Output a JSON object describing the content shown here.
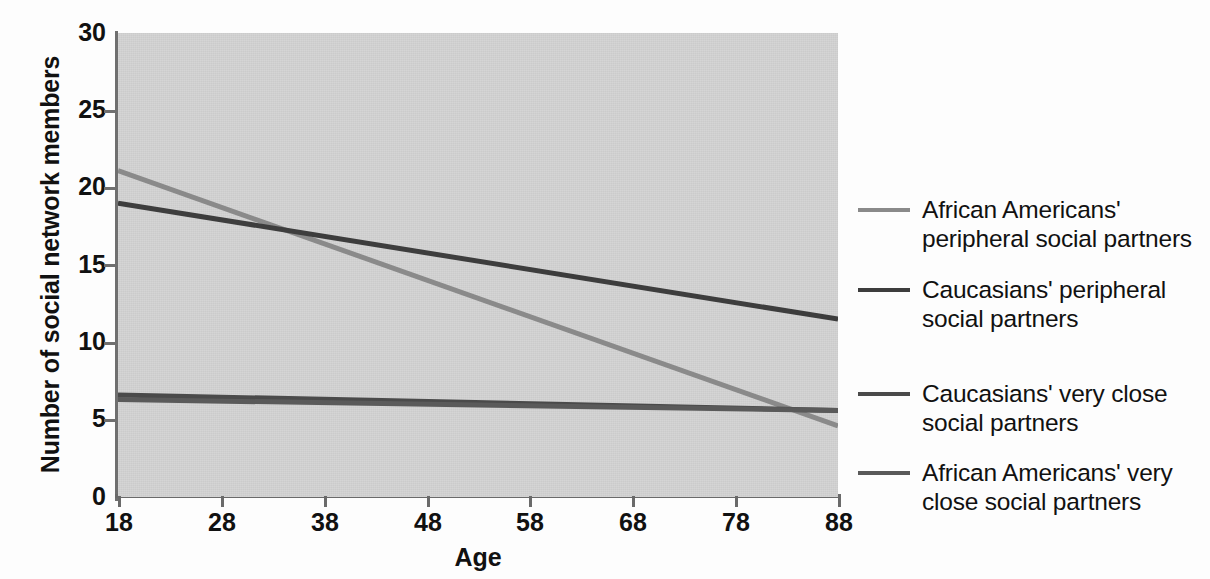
{
  "chart_data": {
    "type": "line",
    "title": "",
    "xlabel": "Age",
    "ylabel": "Number of social network members",
    "xlim": [
      18,
      88
    ],
    "ylim": [
      0,
      30
    ],
    "xticks": [
      18,
      28,
      38,
      48,
      58,
      68,
      78,
      88
    ],
    "yticks": [
      0,
      5,
      10,
      15,
      20,
      25,
      30
    ],
    "grid": false,
    "legend_position": "right",
    "x": [
      18,
      88
    ],
    "series": [
      {
        "name": "African Americans' peripheral social partners",
        "color": "#8a8a8a",
        "values": [
          21.1,
          4.6
        ]
      },
      {
        "name": "Caucasians' peripheral social partners",
        "color": "#3d3d3d",
        "values": [
          19.0,
          11.5
        ]
      },
      {
        "name": "Caucasians' very close social partners",
        "color": "#4a4a4a",
        "values": [
          6.6,
          5.6
        ]
      },
      {
        "name": "African Americans' very close social partners",
        "color": "#5a5a5a",
        "values": [
          6.3,
          5.6
        ]
      }
    ]
  },
  "axes": {
    "ylabel": "Number of social network members",
    "xlabel": "Age",
    "ytick_labels": [
      "30",
      "25",
      "20",
      "15",
      "10",
      "5",
      "0"
    ],
    "xtick_labels": [
      "18",
      "28",
      "38",
      "48",
      "58",
      "68",
      "78",
      "88"
    ]
  },
  "legend": {
    "entries": [
      {
        "label_line1": "African Americans'",
        "label_line2": "peripheral social partners",
        "color": "#8a8a8a"
      },
      {
        "label_line1": "Caucasians' peripheral",
        "label_line2": "social partners",
        "color": "#3d3d3d"
      },
      {
        "label_line1": "Caucasians' very close",
        "label_line2": "social partners",
        "color": "#4a4a4a"
      },
      {
        "label_line1": "African Americans' very",
        "label_line2": "close social partners",
        "color": "#5a5a5a"
      }
    ]
  },
  "colors": {
    "plot_background": "#d3d3d3",
    "axis": "#6a6a6a",
    "text": "#111111"
  }
}
